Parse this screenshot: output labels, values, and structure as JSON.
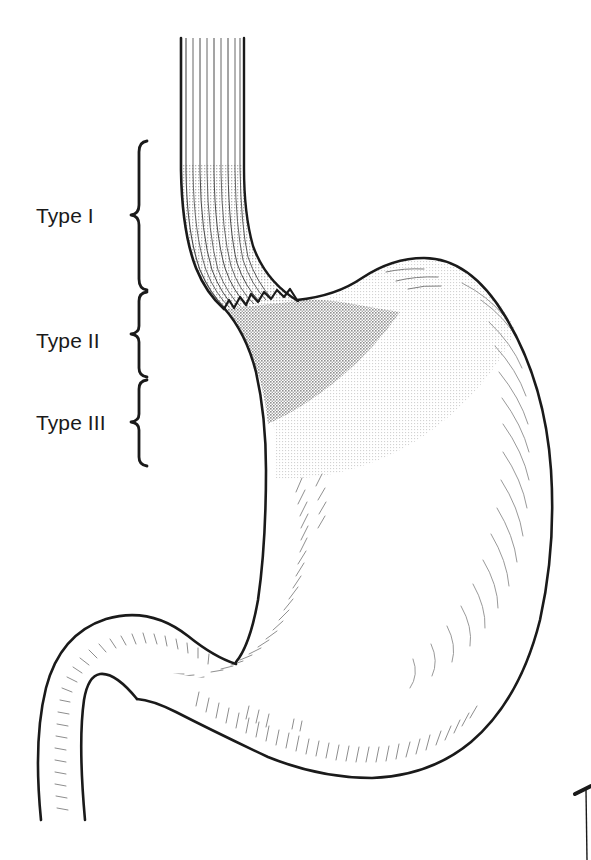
{
  "figure": {
    "name": "stomach-esophagus-anatomy",
    "background_color": "#ffffff",
    "outline_color": "#1a1a1a",
    "width": 591,
    "height": 860
  },
  "labels": [
    {
      "id": "type-1",
      "text": "Type I",
      "x": 36,
      "y": 223,
      "brace": {
        "x": 138,
        "top": 140,
        "bottom": 290,
        "tip_y": 215
      }
    },
    {
      "id": "type-2",
      "text": "Type II",
      "x": 36,
      "y": 348,
      "brace": {
        "x": 138,
        "top": 291,
        "bottom": 377,
        "tip_y": 334
      }
    },
    {
      "id": "type-3",
      "text": "Type III",
      "x": 36,
      "y": 430,
      "brace": {
        "x": 138,
        "top": 379,
        "bottom": 466,
        "tip_y": 422
      }
    }
  ],
  "regions": {
    "esophagus": {
      "name": "esophagus",
      "fill": "#ffffff",
      "fold_count": 9,
      "fold_color": "#3a3a3a",
      "stipple_shading": "#cfcfcf"
    },
    "type_two_zone": {
      "name": "type-ii-shaded-zone",
      "fill": "#b9b9b9",
      "description": "medium gray stippled zone below the Z-line"
    },
    "type_three_zone": {
      "name": "type-iii-shaded-zone",
      "fill": "#ededed",
      "description": "light gray stippled zone of the gastric fundus and body"
    },
    "z_line": {
      "name": "z-line",
      "color": "#1a1a1a",
      "description": "zigzag squamocolumnar junction"
    },
    "stomach_body": {
      "name": "stomach-body",
      "fill": "#ffffff",
      "hatch_color": "#8a8a8a"
    },
    "duodenum": {
      "name": "duodenum",
      "fill": "#ffffff",
      "hatch_color": "#8a8a8a"
    }
  },
  "corner_mark": {
    "name": "corner-crop-mark",
    "color": "#1a1a1a",
    "visible": true
  }
}
